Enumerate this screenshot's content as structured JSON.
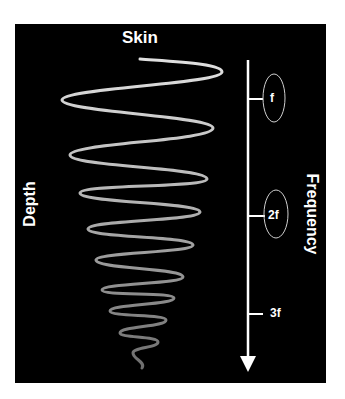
{
  "diagram": {
    "top_label": "Skin",
    "left_axis_label": "Depth",
    "right_axis_label": "Frequency",
    "frequency_ticks": [
      {
        "label": "f",
        "circled": true
      },
      {
        "label": "2f",
        "circled": true
      },
      {
        "label": "3f",
        "circled": false
      }
    ],
    "colors": {
      "background": "#000000",
      "page": "#ffffff",
      "wave_top": "#dddddd",
      "wave_bottom": "#707070",
      "axis": "#ffffff"
    }
  }
}
